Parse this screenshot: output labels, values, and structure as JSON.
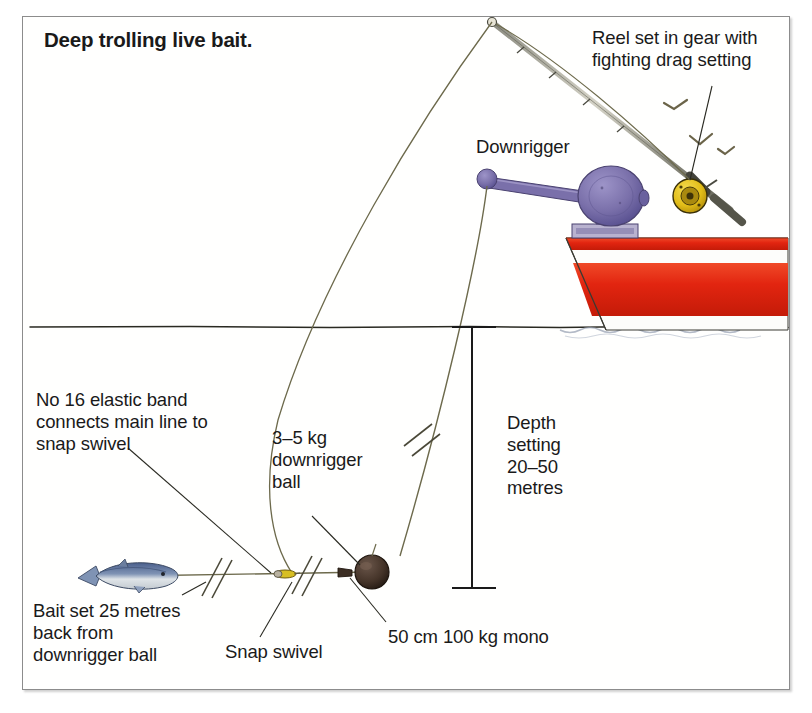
{
  "figure": {
    "title": "Deep trolling live bait.",
    "frame_color": "#8c8c8c",
    "background": "#ffffff"
  },
  "labels": {
    "reel_note": "Reel set in gear with\nfighting drag setting",
    "downrigger": "Downrigger",
    "elastic_note": "No 16 elastic band\nconnects main line to\nsnap swivel",
    "ball_note": "3–5 kg\ndownrigger\nball",
    "depth_note": "Depth\nsetting\n20–50\nmetres",
    "bait_note": "Bait set 25 metres\nback from\ndownrigger ball",
    "snap_swivel": "Snap swivel",
    "mono_leader": "50 cm 100 kg mono"
  },
  "colors": {
    "hull_red": "#e02510",
    "hull_white": "#fdfdfb",
    "downrigger_purple": "#7c72ac",
    "downrigger_purple_dark": "#5d5590",
    "reel_yellow": "#e8c41c",
    "reel_dark": "#5a4a12",
    "ball_dark": "#4a3a30",
    "line_color": "#6d6a4c",
    "ink": "#1a1a1a",
    "fish_blue": "#5b6e96",
    "fish_silver": "#d8dde2",
    "swivel_yellow": "#d8bf22"
  },
  "annotation_values": {
    "elastic_band_size": "No 16",
    "ball_weight": "3–5 kg",
    "depth_range": "20–50 metres",
    "bait_setback": "25 metres",
    "leader_length": "50 cm",
    "leader_strength": "100 kg"
  },
  "scene": {
    "waterline_label": "waterline",
    "birds_count": 3
  }
}
